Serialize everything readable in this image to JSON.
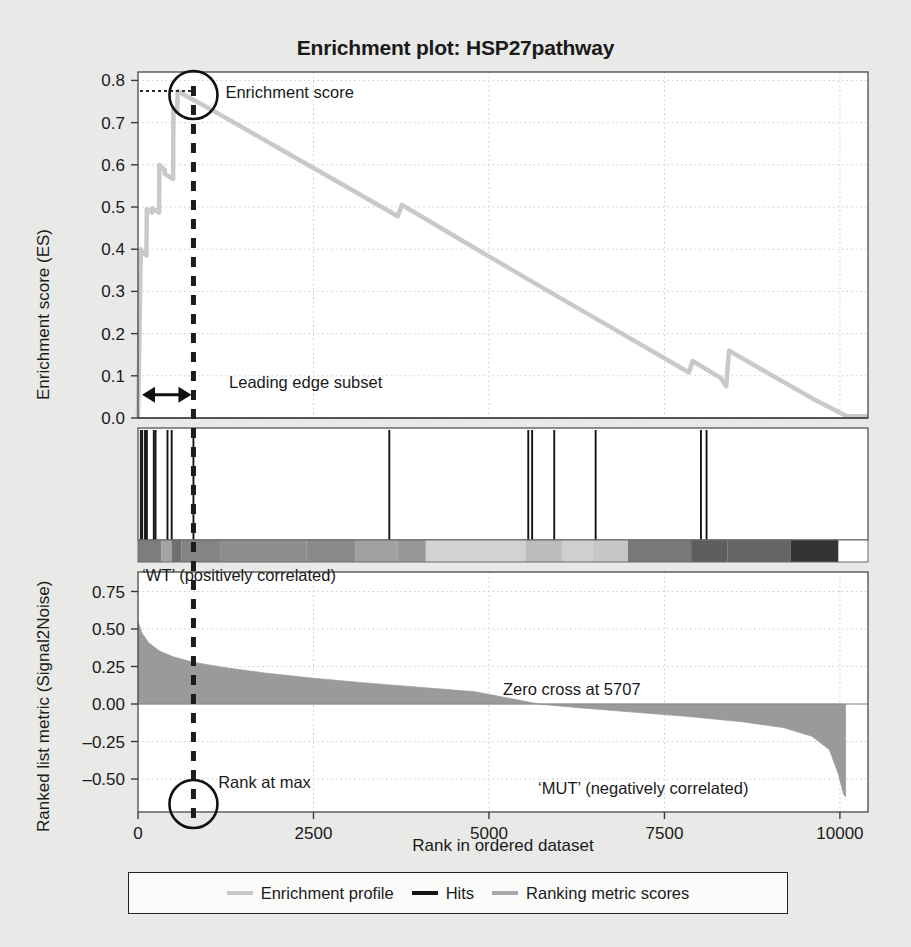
{
  "chart_data": {
    "type": "line",
    "title": "Enrichment plot: HSP27pathway",
    "xlabel": "Rank in ordered dataset",
    "xlim": [
      0,
      10400
    ],
    "xticks": [
      0,
      2500,
      5000,
      7500,
      10000
    ],
    "xticklabels": [
      "0",
      "2500",
      "5000",
      "7500",
      "10000"
    ],
    "grid": true,
    "panels": [
      {
        "name": "enrichment-profile",
        "ylabel": "Enrichment score (ES)",
        "ylim": [
          0.0,
          0.82
        ],
        "yticks": [
          0.0,
          0.1,
          0.2,
          0.3,
          0.4,
          0.5,
          0.6,
          0.7,
          0.8
        ],
        "yticklabels": [
          "0.0",
          "0.1",
          "0.2",
          "0.3",
          "0.4",
          "0.5",
          "0.6",
          "0.7",
          "0.8"
        ],
        "series": [
          {
            "name": "Enrichment profile",
            "color": "#c9c9c9",
            "points": [
              [
                0,
                0.0
              ],
              [
                40,
                0.4
              ],
              [
                45,
                0.395
              ],
              [
                120,
                0.385
              ],
              [
                125,
                0.495
              ],
              [
                200,
                0.487
              ],
              [
                205,
                0.497
              ],
              [
                300,
                0.487
              ],
              [
                305,
                0.6
              ],
              [
                380,
                0.588
              ],
              [
                385,
                0.578
              ],
              [
                500,
                0.566
              ],
              [
                505,
                0.735
              ],
              [
                560,
                0.729
              ],
              [
                565,
                0.775
              ],
              [
                700,
                0.762
              ],
              [
                1000,
                0.735
              ],
              [
                2000,
                0.64
              ],
              [
                3000,
                0.545
              ],
              [
                3700,
                0.478
              ],
              [
                3760,
                0.505
              ],
              [
                4500,
                0.432
              ],
              [
                5000,
                0.383
              ],
              [
                5700,
                0.315
              ],
              [
                6000,
                0.286
              ],
              [
                7000,
                0.19
              ],
              [
                7850,
                0.108
              ],
              [
                7900,
                0.135
              ],
              [
                8300,
                0.095
              ],
              [
                8380,
                0.075
              ],
              [
                8420,
                0.16
              ],
              [
                8500,
                0.152
              ],
              [
                9000,
                0.104
              ],
              [
                9600,
                0.047
              ],
              [
                10100,
                0.004
              ],
              [
                10400,
                0.004
              ]
            ]
          }
        ],
        "annotations": [
          {
            "name": "enrichment-score-label",
            "text": "Enrichment score",
            "x": 790,
            "y": 0.775
          },
          {
            "name": "leading-edge-label",
            "text": "Leading edge subset",
            "x": 870,
            "y": 0.085
          }
        ],
        "markers": {
          "rank_at_max_x": 790,
          "es_value": 0.775
        }
      },
      {
        "name": "hits",
        "hit_color": "#141414",
        "hits": [
          40,
          60,
          100,
          120,
          125,
          225,
          250,
          420,
          480,
          790,
          3580,
          5560,
          5615,
          5930,
          6520,
          8020,
          8100
        ]
      },
      {
        "name": "ranking-heatmap",
        "bands": [
          {
            "x0": 0,
            "x1": 330,
            "color": "#7d7d7d"
          },
          {
            "x0": 330,
            "x1": 480,
            "color": "#a3a3a3"
          },
          {
            "x0": 480,
            "x1": 620,
            "color": "#6f6f6f"
          },
          {
            "x0": 620,
            "x1": 1180,
            "color": "#848484"
          },
          {
            "x0": 1180,
            "x1": 2400,
            "color": "#8d8d8d"
          },
          {
            "x0": 2400,
            "x1": 3100,
            "color": "#8a8a8a"
          },
          {
            "x0": 3100,
            "x1": 3700,
            "color": "#a1a1a1"
          },
          {
            "x0": 3700,
            "x1": 4100,
            "color": "#979797"
          },
          {
            "x0": 4100,
            "x1": 5520,
            "color": "#d2d2d2"
          },
          {
            "x0": 5520,
            "x1": 6050,
            "color": "#bdbdbd"
          },
          {
            "x0": 6050,
            "x1": 6480,
            "color": "#cfcfcf"
          },
          {
            "x0": 6480,
            "x1": 6980,
            "color": "#c6c6c6"
          },
          {
            "x0": 6980,
            "x1": 7880,
            "color": "#787878"
          },
          {
            "x0": 7880,
            "x1": 8400,
            "color": "#5e5e5e"
          },
          {
            "x0": 8400,
            "x1": 9300,
            "color": "#656565"
          },
          {
            "x0": 9300,
            "x1": 9980,
            "color": "#333333"
          },
          {
            "x0": 9980,
            "x1": 10400,
            "color": "#ffffff"
          }
        ]
      },
      {
        "name": "ranked-list-metric",
        "ylabel": "Ranked list metric (Signal2Noise)",
        "ylim": [
          -0.72,
          0.88
        ],
        "yticks": [
          0.75,
          0.5,
          0.25,
          0.0,
          -0.25,
          -0.5
        ],
        "yticklabels": [
          "0.75",
          "0.50",
          "0.25",
          "0.00",
          "–0.25",
          "–0.50"
        ],
        "series": [
          {
            "name": "Ranking metric scores",
            "color": "#9a9a9a",
            "points": [
              [
                0,
                0.55
              ],
              [
                60,
                0.47
              ],
              [
                150,
                0.41
              ],
              [
                300,
                0.355
              ],
              [
                500,
                0.315
              ],
              [
                790,
                0.278
              ],
              [
                1200,
                0.245
              ],
              [
                1800,
                0.207
              ],
              [
                2500,
                0.172
              ],
              [
                3200,
                0.142
              ],
              [
                4000,
                0.112
              ],
              [
                4800,
                0.082
              ],
              [
                5707,
                0.0
              ],
              [
                6200,
                -0.022
              ],
              [
                7000,
                -0.052
              ],
              [
                7800,
                -0.082
              ],
              [
                8600,
                -0.118
              ],
              [
                9200,
                -0.158
              ],
              [
                9600,
                -0.215
              ],
              [
                9850,
                -0.305
              ],
              [
                9980,
                -0.47
              ],
              [
                10050,
                -0.6
              ],
              [
                10080,
                -0.62
              ]
            ]
          }
        ],
        "annotations": [
          {
            "name": "wt-label",
            "text": "‘WT’ (positively correlated)",
            "x": 60,
            "y": 0.86
          },
          {
            "name": "zero-cross-label",
            "text": "Zero cross at 5707",
            "x": 5200,
            "y": 0.1
          },
          {
            "name": "rank-at-max-label",
            "text": "Rank at max",
            "x": 1000,
            "y": -0.52
          },
          {
            "name": "mut-label",
            "text": "‘MUT’ (negatively correlated)",
            "x": 5700,
            "y": -0.56
          }
        ],
        "zero_cross": 5707,
        "rank_at_max": 790
      }
    ],
    "legend": {
      "position": "bottom",
      "entries": [
        {
          "label": "Enrichment profile",
          "color": "#c9c9c9"
        },
        {
          "label": "Hits",
          "color": "#141414"
        },
        {
          "label": "Ranking metric scores",
          "color": "#a8a8a8"
        }
      ]
    }
  },
  "title": "Enrichment plot: HSP27pathway",
  "axes": {
    "x_label": "Rank in ordered dataset",
    "y_label_top": "Enrichment score (ES)",
    "y_label_bottom": "Ranked list metric (Signal2Noise)",
    "x_ticks": [
      "0",
      "2500",
      "5000",
      "7500",
      "10000"
    ],
    "y_ticks_top": [
      "0.8",
      "0.7",
      "0.6",
      "0.5",
      "0.4",
      "0.3",
      "0.2",
      "0.1",
      "0.0"
    ],
    "y_ticks_bottom": [
      "0.75",
      "0.50",
      "0.25",
      "0.00",
      "–0.25",
      "–0.50"
    ]
  },
  "annotations": {
    "enrichment_score": "Enrichment score",
    "leading_edge": "Leading edge subset",
    "wt": "‘WT’ (positively correlated)",
    "mut": "‘MUT’ (negatively correlated)",
    "zero_cross": "Zero cross at 5707",
    "rank_at_max": "Rank at max"
  },
  "legend": {
    "enrichment_profile": "Enrichment profile",
    "hits": "Hits",
    "ranking_metric": "Ranking metric scores"
  },
  "colors": {
    "enrichment_profile": "#c9c9c9",
    "hits": "#141414",
    "ranking_metric": "#9a9a9a",
    "background": "#e9e9e7",
    "plot_background": "#ffffff",
    "axis": "#3a3a3a"
  }
}
